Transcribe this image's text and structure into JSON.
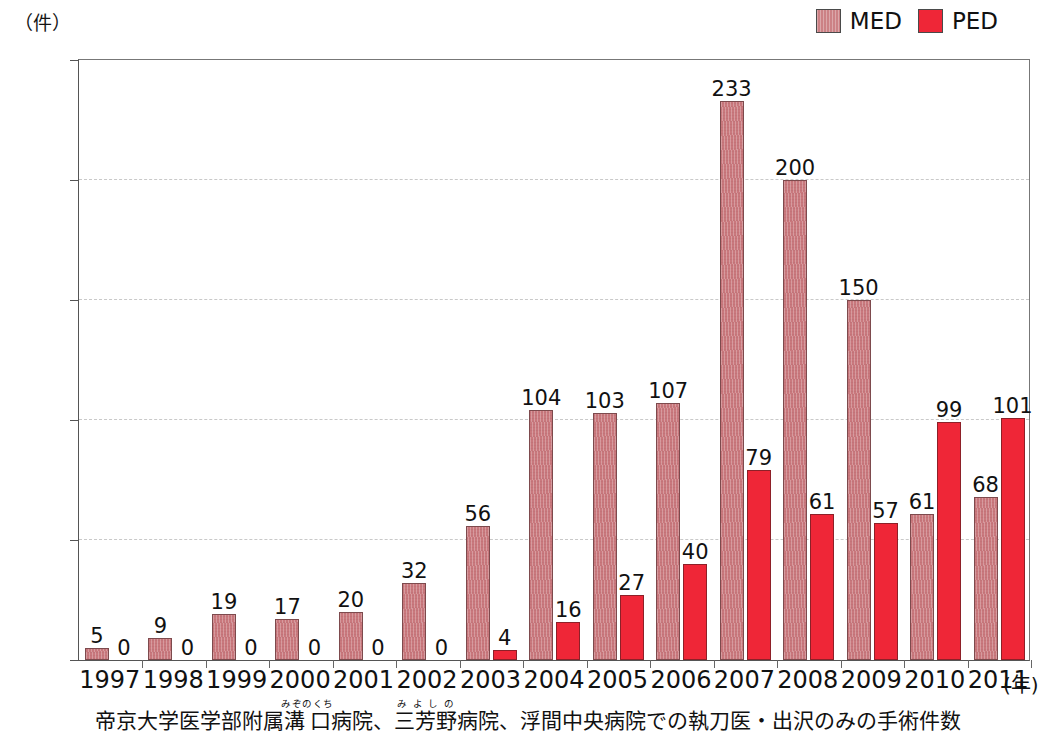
{
  "top_cropped_text": "・・ ・・",
  "axis": {
    "y_unit_label": "（件）",
    "x_unit_label": "(年)",
    "y_ticks": [
      "0",
      "50",
      "100",
      "150",
      "200",
      "250"
    ]
  },
  "legend": {
    "items": [
      {
        "label": "MED",
        "color": "#c9787d",
        "swatch": "med"
      },
      {
        "label": "PED",
        "color": "#ef2637",
        "swatch": "ped"
      }
    ]
  },
  "caption": {
    "part1": "帝京大学医学部附属",
    "ruby1_base": "溝口",
    "ruby1_text": "みぞのくち",
    "part2": "病院、",
    "ruby2_base": "三芳野",
    "ruby2_text": "みよしの",
    "part3": "病院、浮間中央病院での執刀医・出沢のみの手術件数"
  },
  "chart_data": {
    "type": "bar",
    "title": "",
    "subtitle": "",
    "xlabel": "(年)",
    "ylabel": "（件）",
    "ylim": [
      0,
      250
    ],
    "yticks": [
      0,
      50,
      100,
      150,
      200,
      250
    ],
    "grid": true,
    "legend_position": "top-right",
    "categories": [
      "1997",
      "1998",
      "1999",
      "2000",
      "2001",
      "2002",
      "2003",
      "2004",
      "2005",
      "2006",
      "2007",
      "2008",
      "2009",
      "2010",
      "2011"
    ],
    "series": [
      {
        "name": "MED",
        "color": "#c9787d",
        "values": [
          5,
          9,
          19,
          17,
          20,
          32,
          56,
          104,
          103,
          107,
          233,
          200,
          150,
          61,
          68
        ]
      },
      {
        "name": "PED",
        "color": "#ef2637",
        "values": [
          0,
          0,
          0,
          0,
          0,
          0,
          4,
          16,
          27,
          40,
          79,
          61,
          57,
          99,
          101
        ]
      }
    ],
    "annotations": "帝京大学医学部附属溝口病院、三芳野病院、浮間中央病院での執刀医・出沢のみの手術件数"
  }
}
